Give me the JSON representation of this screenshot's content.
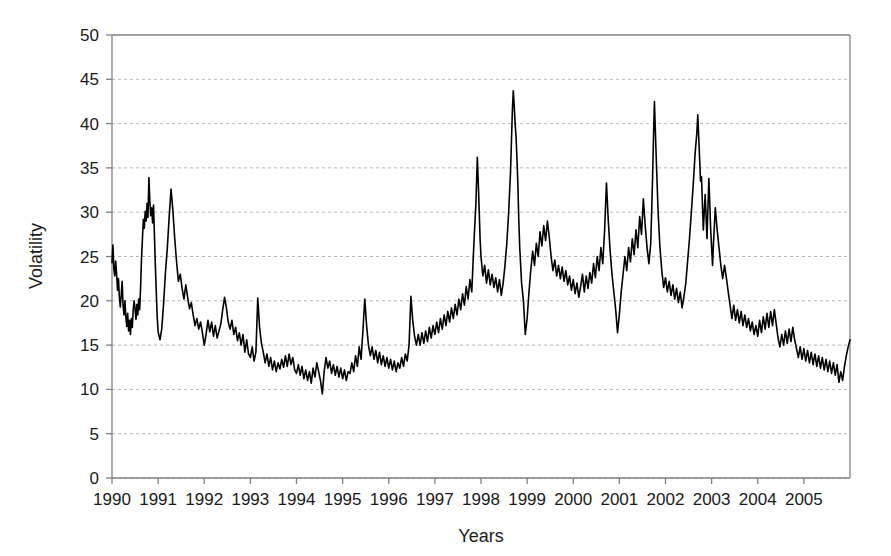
{
  "chart_data": {
    "type": "line",
    "title": "",
    "xlabel": "Years",
    "ylabel": "Volatility",
    "xlim": [
      1990.0,
      2006.0
    ],
    "ylim": [
      0,
      50
    ],
    "ytick_step": 5,
    "yticks": [
      0,
      5,
      10,
      15,
      20,
      25,
      30,
      35,
      40,
      45,
      50
    ],
    "xticks": [
      1990,
      1991,
      1992,
      1993,
      1994,
      1995,
      1996,
      1997,
      1998,
      1999,
      2000,
      2001,
      2002,
      2003,
      2004,
      2005
    ],
    "xtick_labels": [
      "1990",
      "1991",
      "1992",
      "1993",
      "1994",
      "1995",
      "1996",
      "1997",
      "1998",
      "1999",
      "2000",
      "2001",
      "2002",
      "2003",
      "2004",
      "2005"
    ],
    "grid": "horizontal-dotted",
    "grid_color": "#b8b8b8",
    "legend": "none",
    "line_color": "#000000",
    "line_width": 1.6,
    "series": [
      {
        "name": "Volatility",
        "x": [
          1990.0,
          1990.02,
          1990.04,
          1990.06,
          1990.08,
          1990.1,
          1990.12,
          1990.14,
          1990.16,
          1990.18,
          1990.2,
          1990.22,
          1990.24,
          1990.26,
          1990.28,
          1990.3,
          1990.32,
          1990.34,
          1990.36,
          1990.38,
          1990.4,
          1990.42,
          1990.44,
          1990.46,
          1990.48,
          1990.5,
          1990.52,
          1990.54,
          1990.56,
          1990.58,
          1990.6,
          1990.62,
          1990.64,
          1990.66,
          1990.68,
          1990.7,
          1990.72,
          1990.74,
          1990.76,
          1990.78,
          1990.8,
          1990.82,
          1990.84,
          1990.86,
          1990.88,
          1990.9,
          1990.92,
          1990.94,
          1990.96,
          1990.98,
          1991.0,
          1991.04,
          1991.08,
          1991.12,
          1991.16,
          1991.2,
          1991.24,
          1991.28,
          1991.32,
          1991.36,
          1991.4,
          1991.44,
          1991.48,
          1991.52,
          1991.56,
          1991.6,
          1991.64,
          1991.68,
          1991.72,
          1991.76,
          1991.8,
          1991.84,
          1991.88,
          1991.92,
          1991.96,
          1992.0,
          1992.04,
          1992.08,
          1992.12,
          1992.16,
          1992.2,
          1992.24,
          1992.28,
          1992.32,
          1992.36,
          1992.4,
          1992.44,
          1992.48,
          1992.52,
          1992.56,
          1992.6,
          1992.64,
          1992.68,
          1992.72,
          1992.76,
          1992.8,
          1992.84,
          1992.88,
          1992.92,
          1992.96,
          1993.0,
          1993.04,
          1993.08,
          1993.12,
          1993.16,
          1993.2,
          1993.24,
          1993.28,
          1993.32,
          1993.36,
          1993.4,
          1993.44,
          1993.48,
          1993.52,
          1993.56,
          1993.6,
          1993.64,
          1993.68,
          1993.72,
          1993.76,
          1993.8,
          1993.84,
          1993.88,
          1993.92,
          1993.96,
          1994.0,
          1994.04,
          1994.08,
          1994.12,
          1994.16,
          1994.2,
          1994.24,
          1994.28,
          1994.32,
          1994.36,
          1994.4,
          1994.44,
          1994.48,
          1994.52,
          1994.56,
          1994.6,
          1994.64,
          1994.68,
          1994.72,
          1994.76,
          1994.8,
          1994.84,
          1994.88,
          1994.92,
          1994.96,
          1995.0,
          1995.04,
          1995.08,
          1995.12,
          1995.16,
          1995.2,
          1995.24,
          1995.28,
          1995.32,
          1995.36,
          1995.4,
          1995.44,
          1995.48,
          1995.52,
          1995.56,
          1995.6,
          1995.64,
          1995.68,
          1995.72,
          1995.76,
          1995.8,
          1995.84,
          1995.88,
          1995.92,
          1995.96,
          1996.0,
          1996.04,
          1996.08,
          1996.12,
          1996.16,
          1996.2,
          1996.24,
          1996.28,
          1996.32,
          1996.36,
          1996.4,
          1996.44,
          1996.48,
          1996.52,
          1996.56,
          1996.6,
          1996.64,
          1996.68,
          1996.72,
          1996.76,
          1996.8,
          1996.84,
          1996.88,
          1996.92,
          1996.96,
          1997.0,
          1997.04,
          1997.08,
          1997.12,
          1997.16,
          1997.2,
          1997.24,
          1997.28,
          1997.32,
          1997.36,
          1997.4,
          1997.44,
          1997.48,
          1997.52,
          1997.56,
          1997.6,
          1997.64,
          1997.68,
          1997.72,
          1997.76,
          1997.8,
          1997.83,
          1997.86,
          1997.89,
          1997.92,
          1997.95,
          1997.98,
          1998.0,
          1998.04,
          1998.08,
          1998.12,
          1998.16,
          1998.2,
          1998.24,
          1998.28,
          1998.32,
          1998.36,
          1998.4,
          1998.44,
          1998.48,
          1998.52,
          1998.56,
          1998.6,
          1998.64,
          1998.66,
          1998.68,
          1998.7,
          1998.72,
          1998.74,
          1998.76,
          1998.78,
          1998.8,
          1998.82,
          1998.84,
          1998.86,
          1998.88,
          1998.92,
          1998.96,
          1999.0,
          1999.04,
          1999.08,
          1999.12,
          1999.16,
          1999.2,
          1999.24,
          1999.28,
          1999.32,
          1999.36,
          1999.4,
          1999.44,
          1999.48,
          1999.52,
          1999.56,
          1999.6,
          1999.64,
          1999.68,
          1999.72,
          1999.76,
          1999.8,
          1999.84,
          1999.88,
          1999.92,
          1999.96,
          2000.0,
          2000.04,
          2000.08,
          2000.12,
          2000.16,
          2000.2,
          2000.24,
          2000.28,
          2000.32,
          2000.36,
          2000.4,
          2000.44,
          2000.48,
          2000.52,
          2000.56,
          2000.6,
          2000.64,
          2000.68,
          2000.72,
          2000.76,
          2000.8,
          2000.84,
          2000.88,
          2000.92,
          2000.96,
          2001.0,
          2001.04,
          2001.08,
          2001.12,
          2001.16,
          2001.2,
          2001.24,
          2001.28,
          2001.32,
          2001.36,
          2001.4,
          2001.44,
          2001.48,
          2001.52,
          2001.56,
          2001.6,
          2001.64,
          2001.68,
          2001.7,
          2001.72,
          2001.74,
          2001.76,
          2001.8,
          2001.84,
          2001.88,
          2001.92,
          2001.96,
          2002.0,
          2002.04,
          2002.08,
          2002.12,
          2002.16,
          2002.2,
          2002.24,
          2002.28,
          2002.32,
          2002.36,
          2002.4,
          2002.44,
          2002.48,
          2002.52,
          2002.56,
          2002.6,
          2002.64,
          2002.68,
          2002.7,
          2002.72,
          2002.74,
          2002.76,
          2002.78,
          2002.8,
          2002.82,
          2002.84,
          2002.86,
          2002.88,
          2002.9,
          2002.92,
          2002.94,
          2002.96,
          2002.98,
          2003.0,
          2003.02,
          2003.04,
          2003.06,
          2003.08,
          2003.12,
          2003.16,
          2003.2,
          2003.24,
          2003.28,
          2003.32,
          2003.36,
          2003.4,
          2003.44,
          2003.48,
          2003.52,
          2003.56,
          2003.6,
          2003.64,
          2003.68,
          2003.72,
          2003.76,
          2003.8,
          2003.84,
          2003.88,
          2003.92,
          2003.96,
          2004.0,
          2004.04,
          2004.08,
          2004.12,
          2004.16,
          2004.2,
          2004.24,
          2004.28,
          2004.32,
          2004.36,
          2004.4,
          2004.44,
          2004.48,
          2004.52,
          2004.56,
          2004.6,
          2004.64,
          2004.68,
          2004.72,
          2004.76,
          2004.8,
          2004.84,
          2004.88,
          2004.92,
          2004.96,
          2005.0,
          2005.04,
          2005.08,
          2005.12,
          2005.16,
          2005.2,
          2005.24,
          2005.28,
          2005.32,
          2005.36,
          2005.4,
          2005.44,
          2005.48,
          2005.52,
          2005.56,
          2005.6,
          2005.64,
          2005.68,
          2005.72,
          2005.76,
          2005.8,
          2005.84,
          2005.88,
          2005.92,
          2005.96,
          2006.0
        ],
        "values": [
          24.3,
          26.3,
          23.6,
          22.8,
          24.5,
          23.0,
          21.2,
          22.5,
          20.4,
          19.3,
          20.6,
          22.2,
          19.5,
          18.4,
          20.0,
          18.2,
          17.1,
          18.6,
          16.6,
          17.8,
          16.2,
          18.0,
          17.0,
          19.0,
          20.0,
          19.1,
          17.9,
          19.6,
          18.4,
          20.2,
          19.0,
          21.5,
          24.8,
          27.0,
          29.2,
          28.2,
          30.1,
          29.0,
          31.0,
          29.4,
          33.9,
          31.3,
          29.6,
          30.5,
          28.8,
          30.8,
          27.4,
          24.0,
          21.0,
          18.2,
          16.5,
          15.6,
          16.9,
          19.8,
          23.3,
          26.0,
          29.5,
          32.6,
          30.2,
          27.0,
          24.4,
          22.2,
          23.0,
          21.4,
          20.2,
          21.8,
          20.4,
          19.1,
          19.8,
          18.4,
          17.2,
          18.0,
          16.8,
          17.6,
          16.4,
          15.0,
          16.2,
          17.8,
          16.5,
          17.6,
          16.0,
          17.2,
          15.8,
          16.6,
          17.4,
          19.0,
          20.4,
          19.2,
          17.6,
          16.8,
          17.8,
          16.2,
          17.0,
          15.5,
          16.4,
          15.0,
          16.2,
          14.2,
          15.6,
          14.0,
          13.6,
          14.8,
          13.2,
          14.2,
          20.3,
          17.0,
          15.2,
          14.2,
          13.0,
          14.0,
          12.6,
          13.6,
          12.2,
          13.2,
          12.0,
          13.0,
          12.3,
          13.4,
          12.5,
          13.8,
          12.6,
          14.0,
          12.8,
          13.6,
          12.2,
          11.8,
          12.8,
          11.6,
          12.6,
          11.2,
          12.2,
          11.0,
          12.0,
          10.7,
          12.4,
          11.4,
          13.0,
          12.0,
          11.0,
          9.5,
          12.0,
          13.6,
          12.4,
          13.2,
          11.8,
          12.8,
          11.6,
          12.6,
          11.4,
          12.4,
          11.2,
          12.2,
          11.0,
          12.0,
          11.8,
          13.0,
          12.0,
          13.8,
          12.6,
          14.8,
          13.4,
          16.6,
          20.2,
          17.2,
          15.0,
          13.8,
          14.8,
          13.4,
          14.4,
          13.0,
          14.2,
          12.8,
          13.8,
          12.6,
          13.6,
          12.4,
          13.4,
          12.2,
          13.2,
          12.0,
          13.0,
          12.4,
          13.6,
          12.6,
          14.0,
          13.2,
          15.0,
          20.5,
          17.8,
          16.0,
          15.0,
          16.2,
          15.0,
          16.4,
          15.2,
          16.6,
          15.4,
          17.0,
          15.8,
          17.2,
          16.2,
          17.6,
          16.4,
          18.0,
          16.8,
          18.4,
          17.2,
          18.8,
          17.6,
          19.2,
          18.0,
          19.6,
          18.4,
          20.2,
          19.0,
          20.8,
          19.5,
          21.6,
          20.2,
          22.4,
          21.0,
          24.6,
          28.0,
          31.0,
          36.2,
          32.0,
          27.0,
          25.0,
          22.8,
          24.0,
          22.0,
          23.5,
          21.8,
          23.0,
          21.5,
          22.6,
          21.0,
          22.4,
          20.6,
          22.0,
          24.0,
          26.5,
          30.0,
          34.5,
          38.0,
          41.5,
          43.7,
          42.0,
          40.0,
          38.5,
          36.0,
          33.0,
          29.0,
          26.0,
          24.0,
          22.0,
          20.0,
          16.2,
          18.0,
          21.0,
          23.5,
          25.6,
          24.0,
          26.5,
          25.0,
          27.8,
          26.2,
          28.5,
          26.8,
          29.0,
          27.2,
          25.0,
          23.4,
          24.6,
          22.8,
          24.0,
          22.5,
          23.8,
          22.2,
          23.4,
          21.8,
          22.8,
          21.2,
          22.4,
          20.8,
          22.0,
          20.4,
          21.6,
          23.0,
          21.0,
          22.8,
          21.4,
          23.2,
          22.0,
          24.2,
          22.6,
          25.0,
          23.4,
          26.0,
          24.2,
          28.0,
          33.3,
          29.0,
          25.6,
          23.0,
          21.0,
          19.0,
          16.4,
          18.5,
          21.0,
          23.0,
          25.0,
          23.4,
          26.0,
          24.4,
          27.0,
          25.2,
          28.0,
          26.0,
          29.5,
          27.5,
          31.5,
          28.5,
          26.0,
          24.2,
          26.5,
          30.0,
          34.0,
          38.5,
          42.5,
          36.0,
          30.0,
          26.0,
          23.4,
          21.5,
          22.6,
          21.0,
          22.2,
          20.6,
          21.8,
          20.2,
          21.4,
          19.8,
          21.0,
          19.2,
          20.5,
          22.0,
          24.5,
          27.0,
          30.0,
          33.0,
          36.5,
          39.0,
          41.0,
          38.5,
          36.0,
          33.5,
          34.0,
          31.0,
          28.0,
          30.0,
          32.0,
          29.5,
          27.0,
          30.5,
          33.8,
          31.0,
          28.0,
          26.0,
          24.0,
          26.5,
          28.5,
          30.5,
          28.0,
          26.0,
          24.0,
          22.5,
          24.0,
          22.6,
          21.0,
          19.5,
          18.0,
          19.5,
          17.8,
          19.0,
          17.5,
          18.8,
          17.2,
          18.4,
          17.0,
          18.0,
          16.6,
          17.6,
          16.2,
          17.2,
          16.0,
          17.8,
          16.4,
          18.2,
          16.8,
          18.6,
          17.0,
          18.8,
          17.2,
          19.0,
          17.4,
          15.8,
          14.8,
          16.2,
          15.0,
          16.6,
          15.2,
          16.8,
          15.4,
          17.0,
          15.6,
          14.6,
          13.6,
          14.8,
          13.4,
          14.6,
          13.2,
          14.4,
          13.0,
          14.2,
          12.8,
          14.0,
          12.6,
          13.8,
          12.4,
          13.6,
          12.2,
          13.4,
          12.0,
          13.2,
          11.8,
          13.0,
          11.6,
          12.8,
          10.8,
          12.0,
          11.0,
          12.6,
          13.8,
          14.8,
          15.6
        ]
      }
    ]
  },
  "axes": {
    "x_title": "Years",
    "y_title": "Volatility",
    "y_tick_labels": [
      "50",
      "45",
      "40",
      "35",
      "30",
      "25",
      "20",
      "15",
      "10",
      "5",
      "0"
    ],
    "x_tick_labels": [
      "1990",
      "1991",
      "1992",
      "1993",
      "1994",
      "1995",
      "1996",
      "1997",
      "1998",
      "1999",
      "2000",
      "2001",
      "2002",
      "2003",
      "2004",
      "2005"
    ]
  },
  "style": {
    "background": "#ffffff",
    "axis_color": "#808080",
    "grid_color": "#b8b8b8",
    "series_color": "#000000"
  }
}
